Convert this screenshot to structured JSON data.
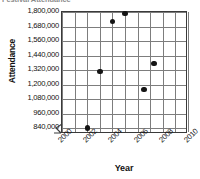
{
  "chart": {
    "title": "Festival Attendance",
    "xlabel": "Year",
    "ylabel": "Attendance"
  },
  "chart_data": {
    "type": "scatter",
    "title": "Festival Attendance",
    "xlabel": "Year",
    "ylabel": "Attendance",
    "xlim": [
      2000,
      2010
    ],
    "ylim": [
      840000,
      1800000
    ],
    "xticks": [
      "2000",
      "2002",
      "2004",
      "2006",
      "2008",
      "2010"
    ],
    "xtick_values": [
      2000,
      2002,
      2004,
      2006,
      2008,
      2010
    ],
    "xtick_step": 2,
    "minor_x_gridlines": true,
    "yticks": [
      "840,000",
      "960,000",
      "1,080,000",
      "1,200,000",
      "1,320,000",
      "1,440,000",
      "1,560,000",
      "1,680,000",
      "1,800,000"
    ],
    "ytick_values": [
      840000,
      960000,
      1080000,
      1200000,
      1320000,
      1440000,
      1560000,
      1680000,
      1800000
    ],
    "ytick_step": 120000,
    "y_axis_break": true,
    "grid": true,
    "legend": false,
    "marker": "filled-circle",
    "marker_color": "#141414",
    "points": [
      {
        "x": 2002.0,
        "y": 840000
      },
      {
        "x": 2003.0,
        "y": 1310000
      },
      {
        "x": 2004.0,
        "y": 1720000
      },
      {
        "x": 2005.0,
        "y": 1790000
      },
      {
        "x": 2006.5,
        "y": 1160000
      },
      {
        "x": 2007.3,
        "y": 1375000
      }
    ]
  }
}
